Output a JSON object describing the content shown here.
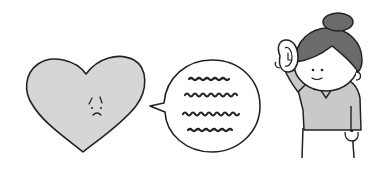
{
  "illustration": {
    "alt": "A sad heart speaks through a speech bubble to a smiling woman holding her hand to her ear, listening",
    "heart": {
      "label": "sad heart",
      "fill": "#d6d6d6",
      "expression": "sad"
    },
    "speech_bubble": {
      "label": "speech bubble",
      "lines": 4,
      "content": "illegible scribbled text"
    },
    "woman": {
      "label": "listening woman",
      "gesture": "hand cupped to ear",
      "hair_color": "#6b6b6b",
      "shirt_color": "#c9c9c9"
    }
  },
  "colors": {
    "stroke": "#222222",
    "background": "#ffffff",
    "heart_fill": "#d6d6d6",
    "hair": "#6b6b6b",
    "shirt": "#c9c9c9",
    "skin": "#ffffff"
  }
}
